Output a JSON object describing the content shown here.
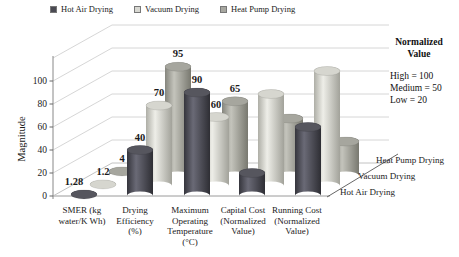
{
  "legend": {
    "items": [
      {
        "label": "Hot Air Drying",
        "color": "#4a4a52"
      },
      {
        "label": "Vacuum Drying",
        "color": "#d8d8d2"
      },
      {
        "label": "Heat Pump Drying",
        "color": "#a7a7a0"
      }
    ]
  },
  "annotation": {
    "title_lines": [
      "Normalized",
      "Value"
    ],
    "lines": [
      "High = 100",
      "Medium = 50",
      "Low = 20"
    ]
  },
  "chart_data": {
    "type": "bar",
    "style": "3d-cylinder",
    "title": "",
    "xlabel": "",
    "ylabel": "Magnitude",
    "yticks": [
      0,
      20,
      40,
      60,
      80,
      100
    ],
    "ylim": [
      0,
      120
    ],
    "grid": true,
    "legend_position": "top",
    "categories": [
      "SMER (kg water/K Wh)",
      "Drying Efficiency (%)",
      "Maximum Operating Temperature (°C)",
      "Capital Cost (Normalized Value)",
      "Running Cost (Normalized Value)"
    ],
    "category_label_lines": [
      [
        "SMER (kg",
        "water/K Wh)"
      ],
      [
        "Drying",
        "Efficiency",
        "(%)"
      ],
      [
        "Maximum",
        "Operating",
        "Temperature",
        "(°C)"
      ],
      [
        "Capital Cost",
        "(Normalized",
        "Value)"
      ],
      [
        "Running Cost",
        "(Normalized",
        "Value)"
      ]
    ],
    "series": [
      {
        "name": "Hot Air Drying",
        "color": "#4a4a52",
        "values": [
          1.28,
          40,
          90,
          20,
          60
        ],
        "data_labels": [
          "1.28",
          "40",
          "90",
          "",
          ""
        ]
      },
      {
        "name": "Vacuum Drying",
        "color": "#d8d8d2",
        "values": [
          1.2,
          70,
          60,
          80,
          100
        ],
        "data_labels": [
          "1.2",
          "70",
          "60",
          "",
          ""
        ]
      },
      {
        "name": "Heat Pump Drying",
        "color": "#a7a7a0",
        "values": [
          4,
          95,
          65,
          50,
          30
        ],
        "data_labels": [
          "4",
          "95",
          "65",
          "",
          ""
        ]
      }
    ],
    "depth_axis_labels": [
      "Hot Air Drying",
      "Vacuum Drying",
      "Heat Pump Drying"
    ],
    "normalized_value_key": {
      "High": 100,
      "Medium": 50,
      "Low": 20
    }
  }
}
